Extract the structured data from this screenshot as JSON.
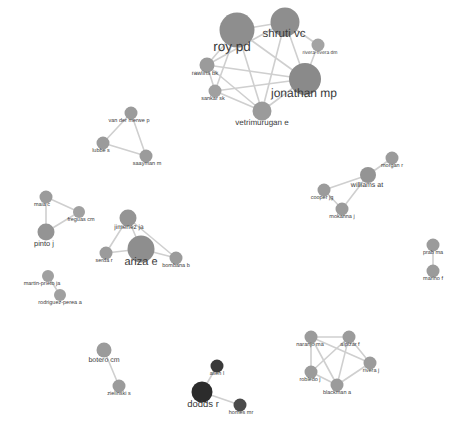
{
  "figure": {
    "type": "network-graph",
    "width": 462,
    "height": 441,
    "background": "#ffffff",
    "edge_color": "#cfcfcf",
    "default_node_color": "#9b9b9b",
    "label_color": "#3a3a3a"
  },
  "nodes": [
    {
      "id": "roy-pd",
      "label": "roy pd",
      "x": 237,
      "y": 30,
      "r": 17.5,
      "color": "#8e8e8e",
      "font": 13.5,
      "lx": 232,
      "ly": 40
    },
    {
      "id": "shruti-vc",
      "label": "shruti vc",
      "x": 285,
      "y": 22,
      "r": 14.5,
      "color": "#8e8e8e",
      "font": 11.5,
      "lx": 284,
      "ly": 29
    },
    {
      "id": "rivera-rivera-dm",
      "label": "rivera-rivera dm",
      "x": 318,
      "y": 45,
      "r": 6.5,
      "color": "#a3a3a3",
      "font": 5.0,
      "lx": 320,
      "ly": 51
    },
    {
      "id": "jonathan-mp",
      "label": "jonathan mp",
      "x": 305,
      "y": 79,
      "r": 16.0,
      "color": "#8a8a8a",
      "font": 12.0,
      "lx": 304,
      "ly": 87
    },
    {
      "id": "rawlins-bk",
      "label": "rawlins bk",
      "x": 207,
      "y": 65,
      "r": 7.5,
      "color": "#9b9b9b",
      "font": 6.0,
      "lx": 205,
      "ly": 71
    },
    {
      "id": "sankar-sk",
      "label": "sankar sk",
      "x": 215,
      "y": 91,
      "r": 6.5,
      "color": "#a0a0a0",
      "font": 5.5,
      "lx": 213,
      "ly": 97
    },
    {
      "id": "vetrimurugan-e",
      "label": "vetrimurugan e",
      "x": 262,
      "y": 111,
      "r": 9.5,
      "color": "#9b9b9b",
      "font": 8.0,
      "lx": 262,
      "ly": 119
    },
    {
      "id": "van-der-merwe-p",
      "label": "van der merwe p",
      "x": 131,
      "y": 113,
      "r": 6.5,
      "color": "#9b9b9b",
      "font": 5.5,
      "lx": 129,
      "ly": 119
    },
    {
      "id": "lubbe-s",
      "label": "lubbe s",
      "x": 103,
      "y": 143,
      "r": 6.5,
      "color": "#9b9b9b",
      "font": 5.5,
      "lx": 101,
      "ly": 149
    },
    {
      "id": "saayman-m",
      "label": "saayman m",
      "x": 146,
      "y": 156,
      "r": 6.5,
      "color": "#9b9b9b",
      "font": 5.5,
      "lx": 147,
      "ly": 162
    },
    {
      "id": "maia-c",
      "label": "maia c",
      "x": 46,
      "y": 197,
      "r": 6.5,
      "color": "#9b9b9b",
      "font": 5.5,
      "lx": 42,
      "ly": 203
    },
    {
      "id": "freguas-cm",
      "label": "freguas cm",
      "x": 79,
      "y": 212,
      "r": 6.0,
      "color": "#a0a0a0",
      "font": 5.5,
      "lx": 81,
      "ly": 218
    },
    {
      "id": "pinto-j",
      "label": "pinto j",
      "x": 46,
      "y": 232,
      "r": 8.5,
      "color": "#949494",
      "font": 7.5,
      "lx": 44,
      "ly": 240
    },
    {
      "id": "jimenez-ja",
      "label": "jimenez ja",
      "x": 128,
      "y": 218,
      "r": 8.5,
      "color": "#949494",
      "font": 6.5,
      "lx": 129,
      "ly": 225
    },
    {
      "id": "ariza-e",
      "label": "ariza e",
      "x": 141,
      "y": 249,
      "r": 13.5,
      "color": "#8e8e8e",
      "font": 11.0,
      "lx": 141,
      "ly": 257
    },
    {
      "id": "serda-r",
      "label": "serda r",
      "x": 106,
      "y": 253,
      "r": 6.5,
      "color": "#9b9b9b",
      "font": 5.5,
      "lx": 104,
      "ly": 259
    },
    {
      "id": "bombana-b",
      "label": "bombana b",
      "x": 176,
      "y": 258,
      "r": 6.5,
      "color": "#9b9b9b",
      "font": 5.5,
      "lx": 176,
      "ly": 264
    },
    {
      "id": "morgan-r",
      "label": "morgan r",
      "x": 392,
      "y": 158,
      "r": 6.5,
      "color": "#9b9b9b",
      "font": 5.5,
      "lx": 392,
      "ly": 164
    },
    {
      "id": "williams-at",
      "label": "williams at",
      "x": 368,
      "y": 175,
      "r": 8.0,
      "color": "#949494",
      "font": 7.0,
      "lx": 367,
      "ly": 182
    },
    {
      "id": "cooper-jg",
      "label": "cooper jg",
      "x": 324,
      "y": 190,
      "r": 6.5,
      "color": "#9b9b9b",
      "font": 5.5,
      "lx": 322,
      "ly": 196
    },
    {
      "id": "mokanna-j",
      "label": "mokanna j",
      "x": 342,
      "y": 209,
      "r": 6.5,
      "color": "#9b9b9b",
      "font": 5.5,
      "lx": 342,
      "ly": 215
    },
    {
      "id": "prab-ma",
      "label": "prab ma",
      "x": 433,
      "y": 245,
      "r": 6.5,
      "color": "#9b9b9b",
      "font": 5.5,
      "lx": 433,
      "ly": 251
    },
    {
      "id": "marino-f",
      "label": "marino f",
      "x": 433,
      "y": 271,
      "r": 6.5,
      "color": "#9b9b9b",
      "font": 5.5,
      "lx": 433,
      "ly": 277
    },
    {
      "id": "martin-prieto-ja",
      "label": "martin-prieto ja",
      "x": 48,
      "y": 276,
      "r": 6.0,
      "color": "#a0a0a0",
      "font": 5.5,
      "lx": 42,
      "ly": 282
    },
    {
      "id": "rodriguez-perea-a",
      "label": "rodriguez-perea a",
      "x": 60,
      "y": 295,
      "r": 6.0,
      "color": "#a0a0a0",
      "font": 5.5,
      "lx": 60,
      "ly": 301
    },
    {
      "id": "botero-cm",
      "label": "botero cm",
      "x": 104,
      "y": 350,
      "r": 7.5,
      "color": "#9b9b9b",
      "font": 7.0,
      "lx": 104,
      "ly": 357
    },
    {
      "id": "zielinski-s",
      "label": "zielinski s",
      "x": 119,
      "y": 386,
      "r": 6.5,
      "color": "#9b9b9b",
      "font": 5.5,
      "lx": 119,
      "ly": 392
    },
    {
      "id": "dodds-r",
      "label": "dodds r",
      "x": 202,
      "y": 392,
      "r": 10.5,
      "color": "#2c2c2c",
      "font": 9.5,
      "lx": 203,
      "ly": 400
    },
    {
      "id": "allen-l",
      "label": "allen l",
      "x": 217,
      "y": 366,
      "r": 6.5,
      "color": "#3a3a3a",
      "font": 5.5,
      "lx": 217,
      "ly": 372
    },
    {
      "id": "homes-mr",
      "label": "homes mr",
      "x": 240,
      "y": 405,
      "r": 6.5,
      "color": "#4a4a4a",
      "font": 5.5,
      "lx": 241,
      "ly": 411
    },
    {
      "id": "naranjo-ma",
      "label": "naranjo ma",
      "x": 311,
      "y": 337,
      "r": 6.5,
      "color": "#9b9b9b",
      "font": 5.5,
      "lx": 310,
      "ly": 343
    },
    {
      "id": "alpizar-f",
      "label": "alpizar f",
      "x": 349,
      "y": 337,
      "r": 6.5,
      "color": "#9b9b9b",
      "font": 5.5,
      "lx": 350,
      "ly": 343
    },
    {
      "id": "robledo-j",
      "label": "robledo j",
      "x": 311,
      "y": 372,
      "r": 6.5,
      "color": "#9b9b9b",
      "font": 5.5,
      "lx": 310,
      "ly": 378
    },
    {
      "id": "rivera-j",
      "label": "rivera j",
      "x": 370,
      "y": 363,
      "r": 6.5,
      "color": "#9b9b9b",
      "font": 5.5,
      "lx": 371,
      "ly": 369
    },
    {
      "id": "blackman-a",
      "label": "blackman a",
      "x": 337,
      "y": 385,
      "r": 6.5,
      "color": "#9b9b9b",
      "font": 5.5,
      "lx": 337,
      "ly": 391
    }
  ],
  "edges": [
    {
      "source": "roy-pd",
      "target": "shruti-vc"
    },
    {
      "source": "roy-pd",
      "target": "jonathan-mp"
    },
    {
      "source": "roy-pd",
      "target": "rawlins-bk"
    },
    {
      "source": "roy-pd",
      "target": "sankar-sk"
    },
    {
      "source": "roy-pd",
      "target": "vetrimurugan-e"
    },
    {
      "source": "shruti-vc",
      "target": "jonathan-mp"
    },
    {
      "source": "shruti-vc",
      "target": "rivera-rivera-dm"
    },
    {
      "source": "shruti-vc",
      "target": "vetrimurugan-e"
    },
    {
      "source": "shruti-vc",
      "target": "rawlins-bk"
    },
    {
      "source": "jonathan-mp",
      "target": "rivera-rivera-dm"
    },
    {
      "source": "jonathan-mp",
      "target": "vetrimurugan-e"
    },
    {
      "source": "jonathan-mp",
      "target": "sankar-sk"
    },
    {
      "source": "jonathan-mp",
      "target": "rawlins-bk"
    },
    {
      "source": "rawlins-bk",
      "target": "sankar-sk"
    },
    {
      "source": "rawlins-bk",
      "target": "vetrimurugan-e"
    },
    {
      "source": "sankar-sk",
      "target": "vetrimurugan-e"
    },
    {
      "source": "van-der-merwe-p",
      "target": "lubbe-s"
    },
    {
      "source": "van-der-merwe-p",
      "target": "saayman-m"
    },
    {
      "source": "lubbe-s",
      "target": "saayman-m"
    },
    {
      "source": "maia-c",
      "target": "freguas-cm"
    },
    {
      "source": "maia-c",
      "target": "pinto-j"
    },
    {
      "source": "freguas-cm",
      "target": "pinto-j"
    },
    {
      "source": "jimenez-ja",
      "target": "ariza-e"
    },
    {
      "source": "jimenez-ja",
      "target": "serda-r"
    },
    {
      "source": "ariza-e",
      "target": "serda-r"
    },
    {
      "source": "ariza-e",
      "target": "bombana-b"
    },
    {
      "source": "jimenez-ja",
      "target": "bombana-b"
    },
    {
      "source": "morgan-r",
      "target": "williams-at"
    },
    {
      "source": "williams-at",
      "target": "cooper-jg"
    },
    {
      "source": "cooper-jg",
      "target": "mokanna-j"
    },
    {
      "source": "williams-at",
      "target": "mokanna-j"
    },
    {
      "source": "prab-ma",
      "target": "marino-f"
    },
    {
      "source": "martin-prieto-ja",
      "target": "rodriguez-perea-a"
    },
    {
      "source": "botero-cm",
      "target": "zielinski-s"
    },
    {
      "source": "dodds-r",
      "target": "allen-l"
    },
    {
      "source": "dodds-r",
      "target": "homes-mr"
    },
    {
      "source": "naranjo-ma",
      "target": "alpizar-f"
    },
    {
      "source": "naranjo-ma",
      "target": "robledo-j"
    },
    {
      "source": "naranjo-ma",
      "target": "blackman-a"
    },
    {
      "source": "naranjo-ma",
      "target": "rivera-j"
    },
    {
      "source": "alpizar-f",
      "target": "robledo-j"
    },
    {
      "source": "alpizar-f",
      "target": "blackman-a"
    },
    {
      "source": "alpizar-f",
      "target": "rivera-j"
    },
    {
      "source": "robledo-j",
      "target": "blackman-a"
    },
    {
      "source": "blackman-a",
      "target": "rivera-j"
    }
  ]
}
